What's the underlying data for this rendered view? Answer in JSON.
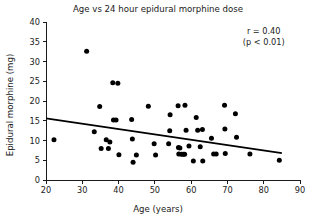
{
  "chart_data": {
    "type": "scatter",
    "title": "Age vs 24 hour epidural morphine dose",
    "xlabel": "Age (years)",
    "ylabel": "Epidural morphine (mg)",
    "xlim": [
      20,
      90
    ],
    "ylim": [
      0,
      40
    ],
    "xticks": [
      20,
      30,
      40,
      50,
      60,
      70,
      80,
      90
    ],
    "yticks": [
      0,
      5,
      10,
      15,
      20,
      25,
      30,
      35,
      40
    ],
    "grid": false,
    "legend": "none",
    "annotations": [
      {
        "text": "r = 0.40",
        "x": 80,
        "y": 37
      },
      {
        "text": "(p < 0.01)",
        "x": 80,
        "y": 34.2
      }
    ],
    "trend_line": {
      "x": [
        20,
        85
      ],
      "y": [
        15.6,
        6.8
      ],
      "style": "solid",
      "color": "#000000"
    },
    "series": [
      {
        "name": "patients",
        "marker": "circle",
        "color": "#000000",
        "points": [
          [
            22.2,
            10.2
          ],
          [
            31.2,
            32.6
          ],
          [
            33.3,
            12.2
          ],
          [
            34.8,
            18.6
          ],
          [
            35.2,
            8.0
          ],
          [
            36.6,
            10.2
          ],
          [
            37.2,
            8.0
          ],
          [
            37.6,
            9.6
          ],
          [
            38.4,
            24.6
          ],
          [
            38.6,
            15.2
          ],
          [
            39.3,
            15.2
          ],
          [
            39.8,
            24.5
          ],
          [
            40.1,
            6.4
          ],
          [
            43.6,
            15.3
          ],
          [
            43.8,
            10.4
          ],
          [
            44.0,
            4.5
          ],
          [
            44.9,
            6.3
          ],
          [
            48.2,
            18.7
          ],
          [
            49.8,
            9.2
          ],
          [
            50.2,
            6.3
          ],
          [
            53.8,
            9.2
          ],
          [
            54.1,
            12.5
          ],
          [
            54.2,
            16.5
          ],
          [
            56.4,
            18.8
          ],
          [
            56.5,
            8.2
          ],
          [
            56.9,
            8.1
          ],
          [
            56.6,
            6.6
          ],
          [
            57.3,
            6.5
          ],
          [
            57.8,
            6.5
          ],
          [
            58.2,
            6.5
          ],
          [
            58.3,
            18.9
          ],
          [
            58.6,
            12.6
          ],
          [
            59.4,
            8.6
          ],
          [
            60.6,
            4.8
          ],
          [
            61.4,
            15.8
          ],
          [
            61.8,
            12.6
          ],
          [
            62.5,
            8.4
          ],
          [
            63.1,
            12.8
          ],
          [
            63.2,
            4.8
          ],
          [
            65.6,
            10.6
          ],
          [
            66.2,
            6.6
          ],
          [
            66.9,
            6.6
          ],
          [
            69.2,
            18.9
          ],
          [
            69.3,
            12.9
          ],
          [
            69.4,
            6.7
          ],
          [
            72.2,
            16.8
          ],
          [
            72.5,
            10.8
          ],
          [
            76.2,
            6.6
          ],
          [
            84.3,
            5.0
          ]
        ]
      }
    ]
  }
}
